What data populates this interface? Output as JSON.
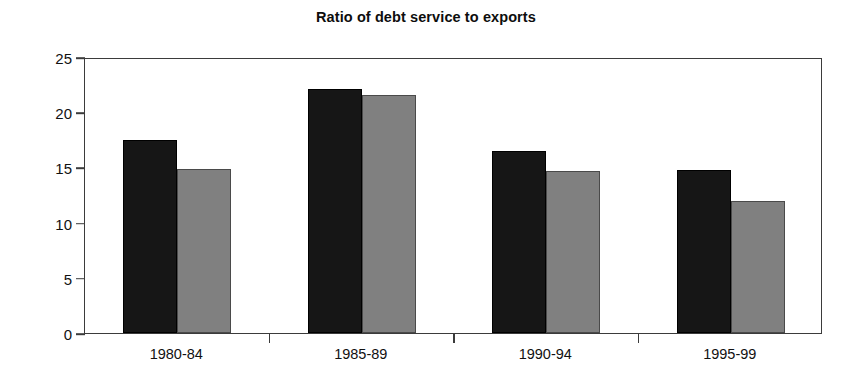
{
  "chart_data": {
    "type": "bar",
    "title": "Ratio of debt service to exports",
    "xlabel": "",
    "ylabel": "",
    "categories": [
      "1980-84",
      "1985-89",
      "1990-94",
      "1995-99"
    ],
    "series": [
      {
        "name": "series-1",
        "color": "#161616",
        "values": [
          17.5,
          22.1,
          16.5,
          14.8
        ]
      },
      {
        "name": "series-2",
        "color": "#808080",
        "values": [
          14.9,
          21.6,
          14.7,
          12.0
        ]
      }
    ],
    "ylim": [
      0,
      25
    ],
    "yticks": [
      0,
      5,
      10,
      15,
      20,
      25
    ],
    "ytick_labels": [
      "0",
      "5",
      "10",
      "15",
      "20",
      "25"
    ],
    "grid": false,
    "legend": "none"
  }
}
